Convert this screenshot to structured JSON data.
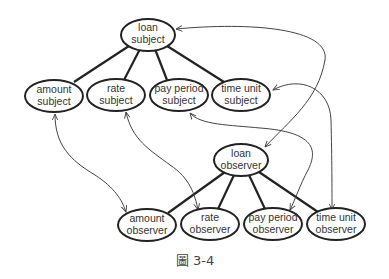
{
  "diagram": {
    "caption": "圖 3-4",
    "nodes": {
      "loan_subject": {
        "line1": "loan",
        "line2": "subject"
      },
      "amount_subject": {
        "line1": "amount",
        "line2": "subject"
      },
      "rate_subject": {
        "line1": "rate",
        "line2": "subject"
      },
      "payperiod_subject": {
        "line1": "pay period",
        "line2": "subject"
      },
      "timeunit_subject": {
        "line1": "time unit",
        "line2": "subject"
      },
      "loan_observer": {
        "line1": "loan",
        "line2": "observer"
      },
      "amount_observer": {
        "line1": "amount",
        "line2": "observer"
      },
      "rate_observer": {
        "line1": "rate",
        "line2": "observer"
      },
      "payperiod_observer": {
        "line1": "pay period",
        "line2": "observer"
      },
      "timeunit_observer": {
        "line1": "time unit",
        "line2": "observer"
      }
    },
    "hierarchy_edges": [
      [
        "loan subject",
        "amount subject"
      ],
      [
        "loan subject",
        "rate subject"
      ],
      [
        "loan subject",
        "pay period subject"
      ],
      [
        "loan subject",
        "time unit subject"
      ],
      [
        "loan observer",
        "amount observer"
      ],
      [
        "loan observer",
        "rate observer"
      ],
      [
        "loan observer",
        "pay period observer"
      ],
      [
        "loan observer",
        "time unit observer"
      ]
    ],
    "bidirectional_arrows": [
      [
        "loan subject",
        "loan observer"
      ],
      [
        "amount subject",
        "amount observer"
      ],
      [
        "rate subject",
        "rate observer"
      ],
      [
        "pay period subject",
        "pay period observer"
      ],
      [
        "time unit subject",
        "time unit observer"
      ]
    ],
    "colors": {
      "stroke": "#222222",
      "arrow": "#444444",
      "text": "#333333",
      "background": "#ffffff"
    }
  }
}
